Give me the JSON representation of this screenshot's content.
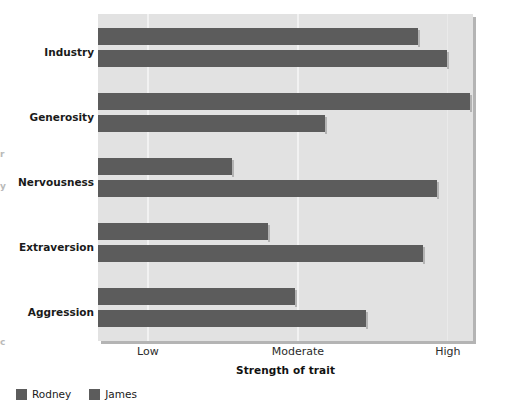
{
  "chart_data": {
    "type": "bar",
    "orientation": "horizontal",
    "grouped": true,
    "title": "",
    "xlabel": "Strength of trait",
    "ylabel": "",
    "categories": [
      "Industry",
      "Generosity",
      "Nervousness",
      "Extraversion",
      "Aggression"
    ],
    "x_tick_labels": [
      "Low",
      "Moderate",
      "High"
    ],
    "x_tick_values": [
      1,
      2,
      3
    ],
    "xlim": [
      0.667,
      3.167
    ],
    "grid": "vertical",
    "legend_position": "below-left",
    "series": [
      {
        "name": "Rodney",
        "color": "#5c5c5c",
        "values": [
          2.8,
          3.15,
          1.56,
          1.8,
          1.98
        ]
      },
      {
        "name": "James",
        "color": "#5c5c5c",
        "values": [
          2.99,
          2.18,
          2.93,
          2.83,
          2.45
        ]
      }
    ],
    "series_names": [
      "Rodney",
      "James"
    ],
    "data_by_category": [
      {
        "category": "Industry",
        "Rodney": 2.8,
        "James": 2.99
      },
      {
        "category": "Generosity",
        "Rodney": 3.15,
        "James": 2.18
      },
      {
        "category": "Nervousness",
        "Rodney": 1.56,
        "James": 2.93
      },
      {
        "category": "Extraversion",
        "Rodney": 1.8,
        "James": 2.83
      },
      {
        "category": "Aggression",
        "Rodney": 1.98,
        "James": 2.45
      }
    ],
    "colors": {
      "bar": "#5c5c5c",
      "plot_background": "#e2e2e2",
      "gridline": "#f2f2f2",
      "text": "#1a1a1a",
      "page_background": "#ffffff"
    }
  },
  "axis": {
    "x_title": "Strength of trait",
    "ticks": [
      {
        "label": "Low",
        "value": 1
      },
      {
        "label": "Moderate",
        "value": 2
      },
      {
        "label": "High",
        "value": 3
      }
    ]
  },
  "categories": [
    {
      "label": "Industry"
    },
    {
      "label": "Generosity"
    },
    {
      "label": "Nervousness"
    },
    {
      "label": "Extraversion"
    },
    {
      "label": "Aggression"
    }
  ],
  "legend": {
    "items": [
      {
        "label": "Rodney",
        "swatch": "legend-swatch-icon",
        "color": "#5c5c5c"
      },
      {
        "label": "James",
        "swatch": "legend-swatch-icon",
        "color": "#5c5c5c"
      }
    ]
  },
  "edge_artifacts": [
    {
      "text": "r"
    },
    {
      "text": "y"
    },
    {
      "text": "c"
    }
  ]
}
